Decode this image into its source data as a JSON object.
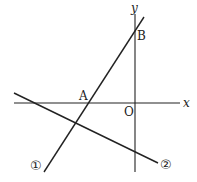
{
  "diagram": {
    "axes": {
      "x_label": "x",
      "y_label": "y",
      "origin_label": "O"
    },
    "points": {
      "A": "A",
      "B": "B"
    },
    "lines": [
      {
        "id": "line-1",
        "label": "①"
      },
      {
        "id": "line-2",
        "label": "②"
      }
    ]
  }
}
